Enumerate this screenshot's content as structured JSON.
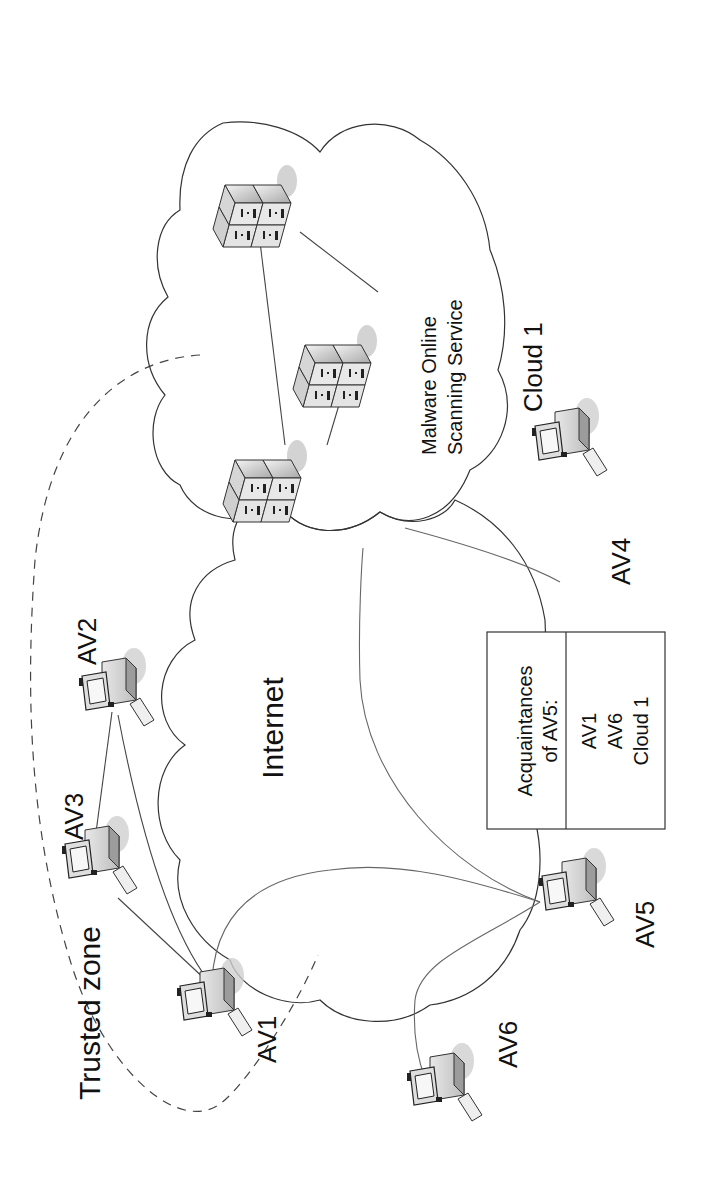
{
  "diagram": {
    "orientation": "rotated 90 degrees counter-clockwise",
    "clouds": {
      "internet": {
        "label": "Internet",
        "fill": "#e6e6e6"
      },
      "cloud1": {
        "label": "Cloud 1",
        "service_line1": "Malware Online",
        "service_line2": "Scanning Service",
        "fill": "#ffffff"
      }
    },
    "trusted_zone": {
      "label": "Trusted zone"
    },
    "nodes": [
      {
        "id": "AV1",
        "label": "AV1"
      },
      {
        "id": "AV2",
        "label": "AV2"
      },
      {
        "id": "AV3",
        "label": "AV3"
      },
      {
        "id": "AV4",
        "label": "AV4"
      },
      {
        "id": "AV5",
        "label": "AV5"
      },
      {
        "id": "AV6",
        "label": "AV6"
      }
    ],
    "servers": [
      {
        "id": "server-1"
      },
      {
        "id": "server-2"
      },
      {
        "id": "server-3"
      }
    ],
    "acquaintances_box": {
      "header_line1": "Acquaintances",
      "header_line2": "of AV5:",
      "items": [
        "AV1",
        "AV6",
        "Cloud 1"
      ]
    },
    "connections": [
      [
        "AV1",
        "AV2"
      ],
      [
        "AV1",
        "AV3"
      ],
      [
        "AV2",
        "AV3"
      ],
      [
        "AV5",
        "AV1"
      ],
      [
        "AV5",
        "AV6"
      ],
      [
        "AV5",
        "Cloud 1"
      ],
      [
        "AV4",
        "Cloud 1"
      ],
      [
        "server-1",
        "server-2"
      ],
      [
        "server-2",
        "server-3"
      ],
      [
        "server-1",
        "server-3"
      ]
    ]
  }
}
